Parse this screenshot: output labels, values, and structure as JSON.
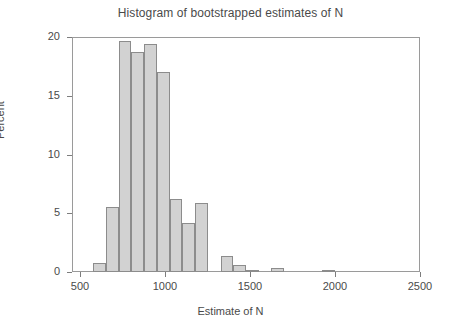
{
  "chart_data": {
    "type": "bar",
    "title": "Histogram of bootstrapped estimates of N",
    "xlabel": "Estimate of N",
    "ylabel": "Percent",
    "xlim": [
      450,
      2500
    ],
    "ylim": [
      0,
      20
    ],
    "xticks": [
      500,
      1000,
      1500,
      2000,
      2500
    ],
    "yticks": [
      0,
      5,
      10,
      15,
      20
    ],
    "grid": false,
    "legend": null,
    "bin_width": 75,
    "bin_starts": [
      575,
      650,
      725,
      800,
      875,
      950,
      1025,
      1100,
      1175,
      1250,
      1325,
      1400,
      1475,
      1550,
      1625,
      1700,
      1775,
      1850,
      1925,
      2000,
      2075,
      2150,
      2225,
      2300
    ],
    "values": [
      0.8,
      5.5,
      19.7,
      18.7,
      19.4,
      17.0,
      6.2,
      4.2,
      5.9,
      0.0,
      1.35,
      0.6,
      0.12,
      0.0,
      0.3,
      0.0,
      0.0,
      0.1,
      0.0,
      0.0,
      0.0,
      0.0,
      0.0,
      0.0
    ],
    "bars": [
      {
        "x0": 575,
        "x1": 650,
        "value": 0.8
      },
      {
        "x0": 650,
        "x1": 725,
        "value": 5.5
      },
      {
        "x0": 725,
        "x1": 800,
        "value": 19.7
      },
      {
        "x0": 800,
        "x1": 875,
        "value": 18.7
      },
      {
        "x0": 875,
        "x1": 950,
        "value": 19.4
      },
      {
        "x0": 950,
        "x1": 1025,
        "value": 17.0
      },
      {
        "x0": 1025,
        "x1": 1100,
        "value": 6.2
      },
      {
        "x0": 1100,
        "x1": 1175,
        "value": 4.2
      },
      {
        "x0": 1175,
        "x1": 1250,
        "value": 5.9
      },
      {
        "x0": 1325,
        "x1": 1400,
        "value": 1.35
      },
      {
        "x0": 1400,
        "x1": 1475,
        "value": 0.6
      },
      {
        "x0": 1475,
        "x1": 1550,
        "value": 0.12
      },
      {
        "x0": 1625,
        "x1": 1700,
        "value": 0.3
      },
      {
        "x0": 1925,
        "x1": 2000,
        "value": 0.1
      }
    ],
    "colors": {
      "bar_fill": "#d2d2d2",
      "bar_border": "#8c8c8c",
      "axis": "#9a9a9a",
      "text": "#4a4a4a",
      "background": "#ffffff"
    }
  }
}
